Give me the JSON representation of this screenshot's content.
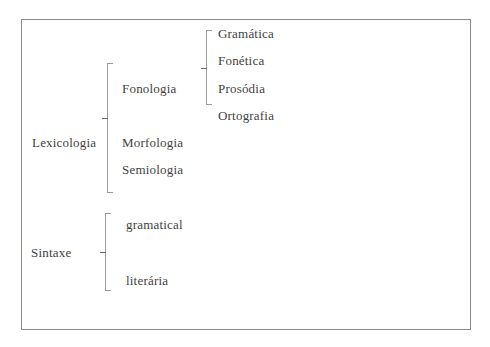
{
  "diagram": {
    "type": "bracket-tree",
    "root_nodes": [
      {
        "label": "Lexicologia",
        "children": [
          {
            "label": "Fonologia",
            "children": [
              {
                "label": "Gramática"
              },
              {
                "label": "Fonética"
              },
              {
                "label": "Prosódia"
              }
            ]
          },
          {
            "label": "Ortografia"
          },
          {
            "label": "Morfologia"
          },
          {
            "label": "Semiologia"
          }
        ]
      },
      {
        "label": "Sintaxe",
        "children": [
          {
            "label": "gramatical"
          },
          {
            "label": "literária"
          }
        ]
      }
    ]
  },
  "labels": {
    "lexicologia": "Lexicologia",
    "fonologia": "Fonologia",
    "gramatica": "Gramática",
    "fonetica": "Fonética",
    "prosodia": "Prosódia",
    "ortografia": "Ortografia",
    "morfologia": "Morfologia",
    "semiologia": "Semiologia",
    "sintaxe": "Sintaxe",
    "gramatical": "gramatical",
    "literaria": "literária"
  },
  "colors": {
    "border": "#8a8a8a",
    "bracket": "#9a9a9a",
    "text": "#3f3f3f",
    "background": "#ffffff"
  }
}
